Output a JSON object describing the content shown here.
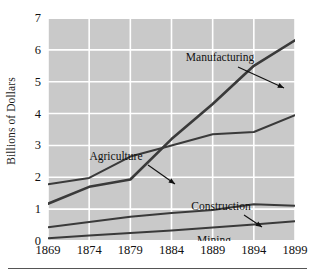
{
  "chart_data": {
    "type": "line",
    "title": "",
    "xlabel": "",
    "ylabel": "Billions of Dollars",
    "x": [
      1869,
      1874,
      1879,
      1884,
      1889,
      1894,
      1899
    ],
    "xtick_labels": [
      "1869",
      "1874",
      "1879",
      "1884",
      "1889",
      "1894",
      "1899"
    ],
    "ytick_labels": [
      "0",
      "1",
      "2",
      "3",
      "4",
      "5",
      "6",
      "7"
    ],
    "yticks": [
      0,
      1,
      2,
      3,
      4,
      5,
      6,
      7
    ],
    "xlim": [
      1869,
      1899
    ],
    "ylim": [
      0,
      7
    ],
    "grid": true,
    "grid_color": "#ffffff",
    "plot_background": "#c9c9c9",
    "legend": "inline-annotations",
    "line_color": "#3a3a3a",
    "series": [
      {
        "name": "Manufacturing",
        "values": [
          1.17,
          1.7,
          1.93,
          3.2,
          4.3,
          5.5,
          6.3
        ]
      },
      {
        "name": "Agriculture",
        "values": [
          1.78,
          1.98,
          2.65,
          3.0,
          3.35,
          3.42,
          3.95
        ]
      },
      {
        "name": "Construction",
        "values": [
          0.43,
          0.6,
          0.76,
          0.88,
          0.97,
          1.15,
          1.11
        ]
      },
      {
        "name": "Mining",
        "values": [
          0.09,
          0.17,
          0.25,
          0.33,
          0.42,
          0.52,
          0.62
        ]
      }
    ],
    "annotations": [
      {
        "label": "Manufacturing",
        "series": "Manufacturing",
        "text_x": 172,
        "text_y": 43,
        "arrow": true,
        "arrow_from_x": 190,
        "arrow_from_y": 49,
        "arrow_to_x": 236,
        "arrow_to_y": 70
      },
      {
        "label": "Agriculture",
        "series": "Agriculture",
        "text_x": 68,
        "text_y": 142,
        "arrow": true,
        "arrow_from_x": 100,
        "arrow_from_y": 147,
        "arrow_to_x": 127,
        "arrow_to_y": 166
      },
      {
        "label": "Construction",
        "series": "Construction",
        "text_x": 173,
        "text_y": 192,
        "arrow": true,
        "arrow_from_x": 196,
        "arrow_from_y": 197,
        "arrow_to_x": 214,
        "arrow_to_y": 209
      },
      {
        "label": "Mining",
        "series": "Mining",
        "text_x": 166,
        "text_y": 226,
        "arrow": false
      }
    ]
  }
}
